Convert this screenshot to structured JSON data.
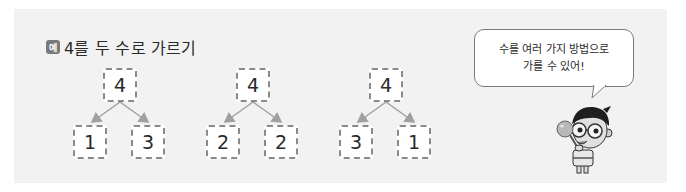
{
  "example": {
    "badge_label": "예",
    "title": "4를 두 수로 가르기"
  },
  "decompositions": [
    {
      "whole": "4",
      "left": "1",
      "right": "3"
    },
    {
      "whole": "4",
      "left": "2",
      "right": "2"
    },
    {
      "whole": "4",
      "left": "3",
      "right": "1"
    }
  ],
  "speech_bubble": {
    "line1": "수를 여러 가지 방법으로",
    "line2": "가를 수 있어!"
  },
  "character": {
    "icon": "boy-with-glasses-character"
  },
  "colors": {
    "panel_bg": "#f2f2f2",
    "badge_bg": "#7a7a7a",
    "box_border": "#8a8a8a",
    "arrow": "#a0a0a0"
  }
}
